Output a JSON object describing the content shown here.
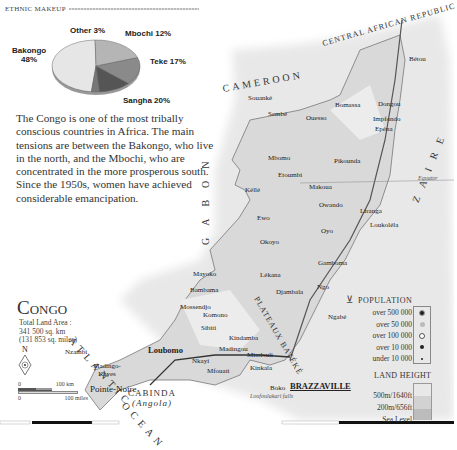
{
  "ethnic_makeup": {
    "heading": "ETHNIC MAKEUP",
    "chart_data": {
      "type": "pie",
      "title": "ETHNIC MAKEUP",
      "categories": [
        "Bakongo",
        "Other",
        "Mbochi",
        "Teke",
        "Sangha"
      ],
      "values": [
        48,
        3,
        12,
        17,
        20
      ],
      "labels": [
        "Bakongo 48%",
        "Other 3%",
        "Mbochi 12%",
        "Teke 17%",
        "Sangha 20%"
      ],
      "colors": [
        "#e6e6e6",
        "#777777",
        "#555555",
        "#8a8a8a",
        "#b5b5b5"
      ]
    }
  },
  "description": "The Congo is one of the most tribally conscious countries in Africa. The main tensions are between the Bakongo, who live in the north, and the Mbochi, who are concentrated in the more prosperous south. Since the 1950s, women have achieved considerable emancipation.",
  "country": {
    "title": "Congo",
    "area_label": "Total Land Area :",
    "area_km": "341 500 sq. km",
    "area_miles": "(131 853 sq. miles)"
  },
  "compass": {
    "label": "N"
  },
  "scale": {
    "zero": "0",
    "km": "100 km",
    "miles": "100 miles"
  },
  "map": {
    "countries": [
      "CAMEROON",
      "CENTRAL AFRICAN REPUBLIC",
      "GABON",
      "ZAIRE",
      "CABINDA",
      "(Angola)"
    ],
    "water": [
      "ATLANTIC",
      "OCEAN"
    ],
    "regions": [
      "PLATEAUX BATÉKÉ"
    ],
    "features": [
      "Equator",
      "Monts de la Lékéti 1040m",
      "Stanley Pool",
      "Loufoulakari falls"
    ],
    "capital": "BRAZZAVILLE",
    "cities": [
      "Souanké",
      "Sembé",
      "Ouesso",
      "Bomassa",
      "Bétou",
      "Dongou",
      "Impfondo",
      "Epéna",
      "Mbomo",
      "Etoumbi",
      "Kéllé",
      "Makoua",
      "Pikounda",
      "Ewo",
      "Owando",
      "Liranga",
      "Loukoléla",
      "Okoyo",
      "Oyo",
      "Gamboma",
      "Mossaka",
      "Mayoko",
      "Bambama",
      "Lékana",
      "Djambala",
      "Ngo",
      "Ngabé",
      "Mossendjo",
      "Komono",
      "Sibiti",
      "Kindamba",
      "Nzambi",
      "Loubomo",
      "Madingou",
      "Mindouli",
      "Madingo-Kayes",
      "Nkayi",
      "Mfouati",
      "Kinkala",
      "Boko",
      "Pointe-Noire"
    ],
    "rivers": [
      "Ngoko",
      "Sangha",
      "Ubangi",
      "Likouala",
      "Kouyou",
      "Alima",
      "Léfini",
      "Niari",
      "Bouenza",
      "Lac Tchibenda",
      "Lékoumou",
      "Motaba",
      "Ibenga",
      "Likouala aux Herbes",
      "Lengoué",
      "Mambili",
      "Congo"
    ]
  },
  "population_legend": {
    "title": "POPULATION",
    "items": [
      "over 500 000",
      "over 50 000",
      "over 100 000",
      "over 10 000",
      "under 10 000"
    ]
  },
  "height_legend": {
    "title": "LAND HEIGHT",
    "items": [
      "500m/1640ft",
      "200m/656ft",
      "Sea Level"
    ],
    "colors": [
      "#e8e8e8",
      "#cfcfcf",
      "#b8b8b8"
    ]
  }
}
